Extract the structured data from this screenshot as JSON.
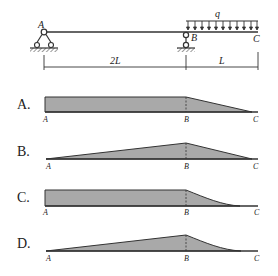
{
  "figure": {
    "beam": {
      "points": {
        "A": "A",
        "B": "B",
        "C": "C"
      },
      "load_label": "q",
      "dimensions": [
        {
          "label": "2L"
        },
        {
          "label": "L"
        }
      ],
      "supports": [
        "pin-support-A",
        "roller-link-support-B"
      ]
    },
    "options": [
      {
        "label": "A.",
        "points": [
          "A",
          "B",
          "C"
        ],
        "shape": "rectangle-then-linear-to-zero"
      },
      {
        "label": "B.",
        "points": [
          "A",
          "B",
          "C"
        ],
        "shape": "linear-rise-then-linear-to-zero"
      },
      {
        "label": "C.",
        "points": [
          "A",
          "B",
          "C"
        ],
        "shape": "rectangle-then-curve-to-zero"
      },
      {
        "label": "D.",
        "points": [
          "A",
          "B",
          "C"
        ],
        "shape": "linear-rise-then-curve-to-zero"
      }
    ],
    "colors": {
      "fill": "#a9a9a9",
      "stroke": "#333333",
      "background": "#ffffff"
    }
  }
}
